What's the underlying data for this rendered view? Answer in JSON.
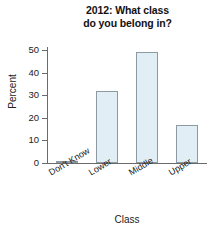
{
  "chart_data": {
    "type": "bar",
    "title": "2012: What class\ndo you belong in?",
    "xlabel": "Class",
    "ylabel": "Percent",
    "categories": [
      "Don't Know",
      "Lower",
      "Middle",
      "Upper"
    ],
    "values": [
      1,
      32,
      49,
      17
    ],
    "ylim": [
      0,
      55
    ],
    "yticks": [
      0,
      10,
      20,
      30,
      40,
      50
    ],
    "ytick_labels": [
      "0",
      "10",
      "20",
      "30",
      "40",
      "50"
    ],
    "grid": false,
    "legend": "none",
    "bar_fill_color": "#e2eef6",
    "bar_edge_color": "#8c9aa3",
    "axis_color": "#6b6b6b",
    "background_color": "#ffffff"
  }
}
